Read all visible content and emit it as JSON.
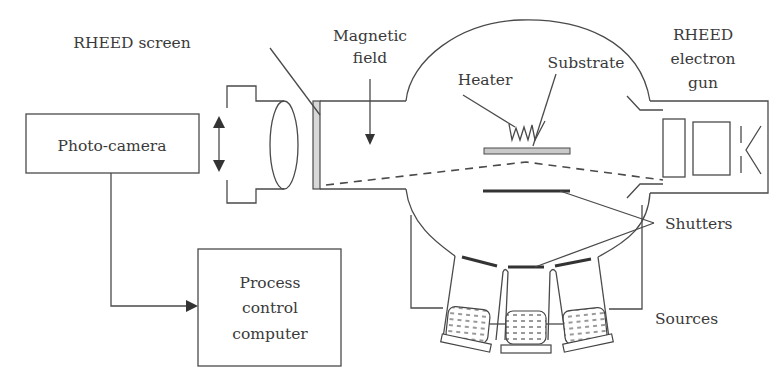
{
  "diagram": {
    "labels": {
      "rheed_screen": "RHEED screen",
      "magnetic_field_line1": "Magnetic",
      "magnetic_field_line2": "field",
      "heater": "Heater",
      "substrate": "Substrate",
      "rheed_gun_line1": "RHEED",
      "rheed_gun_line2": "electron",
      "rheed_gun_line3": "gun",
      "photo_camera": "Photo-camera",
      "process_computer_line1": "Process",
      "process_computer_line2": "control",
      "process_computer_line3": "computer",
      "shutters": "Shutters",
      "sources": "Sources"
    },
    "components": [
      "photo-camera",
      "camera-lens",
      "rheed-screen",
      "magnetic-field-arrow",
      "vacuum-chamber",
      "heater",
      "substrate",
      "electron-beam-path",
      "rheed-electron-gun",
      "shutters",
      "effusion-sources",
      "process-control-computer"
    ],
    "connections": [
      {
        "from": "photo-camera",
        "to": "process-control-computer",
        "type": "arrow"
      }
    ],
    "source_count": 3,
    "shutter_count": 4
  }
}
